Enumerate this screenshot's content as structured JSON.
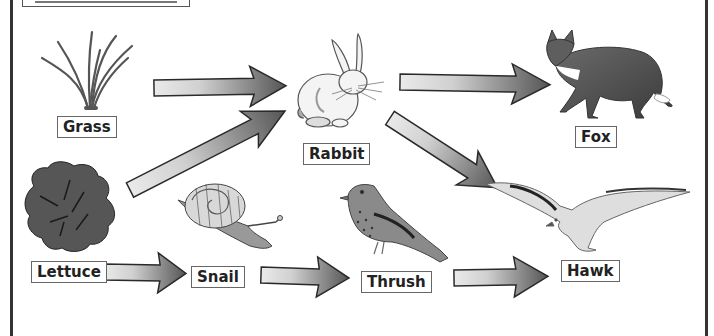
{
  "diagram": {
    "type": "food-web",
    "organisms": [
      {
        "id": "grass",
        "label": "Grass",
        "role": "producer"
      },
      {
        "id": "lettuce",
        "label": "Lettuce",
        "role": "producer"
      },
      {
        "id": "rabbit",
        "label": "Rabbit",
        "role": "primary consumer"
      },
      {
        "id": "snail",
        "label": "Snail",
        "role": "primary consumer"
      },
      {
        "id": "thrush",
        "label": "Thrush",
        "role": "secondary consumer"
      },
      {
        "id": "fox",
        "label": "Fox",
        "role": "predator"
      },
      {
        "id": "hawk",
        "label": "Hawk",
        "role": "predator"
      }
    ],
    "arrows": [
      {
        "from": "Grass",
        "to": "Rabbit"
      },
      {
        "from": "Lettuce",
        "to": "Rabbit"
      },
      {
        "from": "Rabbit",
        "to": "Fox"
      },
      {
        "from": "Rabbit",
        "to": "Hawk"
      },
      {
        "from": "Lettuce",
        "to": "Snail"
      },
      {
        "from": "Snail",
        "to": "Thrush"
      },
      {
        "from": "Thrush",
        "to": "Hawk"
      }
    ]
  },
  "labels": {
    "grass": "Grass",
    "rabbit": "Rabbit",
    "fox": "Fox",
    "lettuce": "Lettuce",
    "snail": "Snail",
    "thrush": "Thrush",
    "hawk": "Hawk"
  },
  "colors": {
    "arrow_light": "#e6e6e6",
    "arrow_dark": "#5a5a5a",
    "outline": "#2a2a2a",
    "frame": "#333333"
  }
}
